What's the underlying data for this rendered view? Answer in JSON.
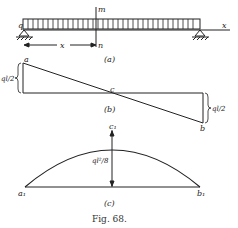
{
  "figure": {
    "caption": "Fig. 68.",
    "panel_a": {
      "label": "(a)",
      "load_label": "q",
      "section_top": "m",
      "section_bottom": "n",
      "distance_label": "x",
      "axis_label": "x"
    },
    "panel_b": {
      "label": "(b)",
      "point_a": "a",
      "point_b": "b",
      "point_c": "c",
      "left_value": "ql/2",
      "right_value": "ql/2"
    },
    "panel_c": {
      "label": "(c)",
      "point_a1": "a₁",
      "point_b1": "b₁",
      "point_c1": "c₁",
      "max_value": "ql²/8"
    }
  }
}
